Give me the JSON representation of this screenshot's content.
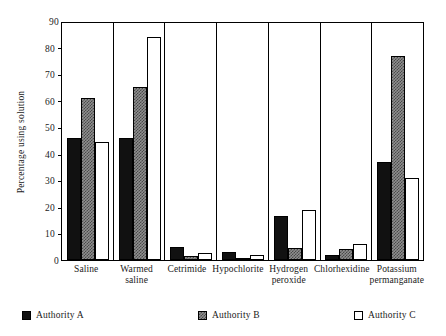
{
  "chart_data": {
    "type": "bar",
    "title": "",
    "xlabel": "",
    "ylabel": "Percentage using solution",
    "ylim": [
      0,
      90
    ],
    "ytick_step": 10,
    "yticks": [
      0,
      10,
      20,
      30,
      40,
      50,
      60,
      70,
      80,
      90
    ],
    "grid": false,
    "legend_position": "bottom",
    "categories": [
      "Saline",
      "Warmed saline",
      "Cetrimide",
      "Hypochlorite",
      "Hydrogen peroxide",
      "Chlorhexidine",
      "Potassium permanganate"
    ],
    "category_lines": [
      [
        "Saline",
        ""
      ],
      [
        "Warmed",
        "saline"
      ],
      [
        "Cetrimide",
        ""
      ],
      [
        "Hypochlorite",
        ""
      ],
      [
        "Hydrogen",
        "peroxide"
      ],
      [
        "Chlorhexidine",
        ""
      ],
      [
        "Potassium",
        "permanganate"
      ]
    ],
    "series": [
      {
        "name": "Authority A",
        "color": "#111111",
        "style": "solid-black",
        "values": [
          46,
          46,
          5,
          3,
          16.5,
          2,
          37
        ]
      },
      {
        "name": "Authority B",
        "color": "#8f8f8f",
        "style": "grey-checkered",
        "values": [
          61,
          65,
          1.5,
          0.5,
          4.5,
          4,
          77
        ]
      },
      {
        "name": "Authority C",
        "color": "#ffffff",
        "style": "white-outline",
        "values": [
          44.5,
          84,
          2.5,
          2,
          19,
          6,
          31
        ]
      }
    ]
  },
  "legend": {
    "items": [
      {
        "label": "Authority A"
      },
      {
        "label": "Authority B"
      },
      {
        "label": "Authority C"
      }
    ]
  }
}
